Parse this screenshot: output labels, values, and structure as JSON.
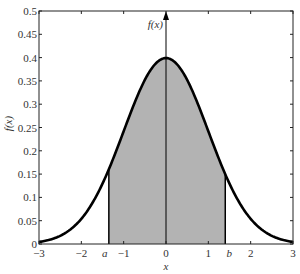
{
  "chart_data": {
    "type": "area",
    "title": "",
    "xlabel": "x",
    "ylabel": "f(x)",
    "axis_annotation": "f(x)",
    "xlim": [
      -3,
      3
    ],
    "ylim": [
      0,
      0.5
    ],
    "grid": false,
    "legend": null,
    "x_ticks": [
      -3,
      -2,
      -1,
      0,
      1,
      2,
      3
    ],
    "x_tick_labels": [
      "−3",
      "−2",
      "−1",
      "0",
      "1",
      "2",
      "3"
    ],
    "y_ticks": [
      0,
      0.05,
      0.1,
      0.15,
      0.2,
      0.25,
      0.3,
      0.35,
      0.4,
      0.45,
      0.5
    ],
    "y_tick_labels": [
      "0",
      "0.05",
      "0.1",
      "0.15",
      "0.2",
      "0.25",
      "0.3",
      "0.35",
      "0.4",
      "0.45",
      "0.5"
    ],
    "series": [
      {
        "name": "standard normal density f(x)",
        "function": "exp(-x^2/2)/sqrt(2*pi)",
        "x": [
          -3,
          -2.5,
          -2,
          -1.5,
          -1,
          -0.5,
          0,
          0.5,
          1,
          1.5,
          2,
          2.5,
          3
        ],
        "values": [
          0.0044,
          0.0175,
          0.054,
          0.1295,
          0.242,
          0.3521,
          0.3989,
          0.3521,
          0.242,
          0.1295,
          0.054,
          0.0175,
          0.0044
        ]
      }
    ],
    "shaded_region": {
      "from_label": "a",
      "to_label": "b",
      "from": -1.35,
      "to": 1.4,
      "color": "#b3b3b3"
    },
    "markers": [
      {
        "label": "a",
        "x": -1.35
      },
      {
        "label": "b",
        "x": 1.4
      }
    ],
    "curve_color": "#000000"
  }
}
